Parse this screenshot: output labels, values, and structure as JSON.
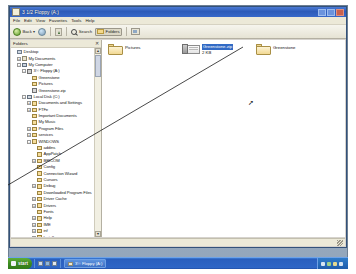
{
  "window": {
    "title": "3 1/2 Floppy (A:)",
    "icon": "floppy-icon",
    "buttons": {
      "minimize": "_",
      "maximize": "[]",
      "close": "X"
    }
  },
  "menubar": {
    "items": [
      "File",
      "Edit",
      "View",
      "Favorites",
      "Tools",
      "Help"
    ]
  },
  "toolbar": {
    "back_label": "Back",
    "back_dropdown": "▾",
    "forward_label": "",
    "up_label": "",
    "search_label": "Search",
    "folders_label": "Folders",
    "views_label": ""
  },
  "folders_pane": {
    "header": "Folders",
    "close_label": "✕",
    "tree": [
      {
        "label": "Desktop",
        "indent": 0,
        "expander": "",
        "icon": "desktop-icon"
      },
      {
        "label": "My Documents",
        "indent": 1,
        "expander": "+",
        "icon": "my-documents-icon"
      },
      {
        "label": "My Computer",
        "indent": 1,
        "expander": "-",
        "icon": "my-computer-icon"
      },
      {
        "label": "3½ Floppy (A:)",
        "indent": 2,
        "expander": "-",
        "icon": "floppy-icon"
      },
      {
        "label": "Greenstone",
        "indent": 3,
        "expander": "",
        "icon": "folder-icon"
      },
      {
        "label": "Pictures",
        "indent": 3,
        "expander": "",
        "icon": "folder-icon"
      },
      {
        "label": "Greenstone.zip",
        "indent": 3,
        "expander": "",
        "icon": "zip-icon"
      },
      {
        "label": "Local Disk (C:)",
        "indent": 2,
        "expander": "-",
        "icon": "disk-icon"
      },
      {
        "label": "Documents and Settings",
        "indent": 3,
        "expander": "+",
        "icon": "folder-icon"
      },
      {
        "label": "FTFe",
        "indent": 3,
        "expander": "+",
        "icon": "folder-icon"
      },
      {
        "label": "Important Documents",
        "indent": 3,
        "expander": "",
        "icon": "folder-icon"
      },
      {
        "label": "My Music",
        "indent": 3,
        "expander": "",
        "icon": "folder-icon"
      },
      {
        "label": "Program Files",
        "indent": 3,
        "expander": "+",
        "icon": "folder-icon"
      },
      {
        "label": "services",
        "indent": 3,
        "expander": "+",
        "icon": "folder-icon"
      },
      {
        "label": "WINDOWS",
        "indent": 3,
        "expander": "-",
        "icon": "folder-icon"
      },
      {
        "label": "addins",
        "indent": 4,
        "expander": "",
        "icon": "folder-icon"
      },
      {
        "label": "AppPatch",
        "indent": 4,
        "expander": "",
        "icon": "folder-icon"
      },
      {
        "label": "BRICOM",
        "indent": 4,
        "expander": "+",
        "icon": "folder-icon"
      },
      {
        "label": "Config",
        "indent": 4,
        "expander": "",
        "icon": "folder-icon"
      },
      {
        "label": "Connection Wizard",
        "indent": 4,
        "expander": "",
        "icon": "folder-icon"
      },
      {
        "label": "Cursors",
        "indent": 4,
        "expander": "",
        "icon": "folder-icon"
      },
      {
        "label": "Debug",
        "indent": 4,
        "expander": "+",
        "icon": "folder-icon"
      },
      {
        "label": "Downloaded Program Files",
        "indent": 4,
        "expander": "",
        "icon": "folder-icon"
      },
      {
        "label": "Driver Cache",
        "indent": 4,
        "expander": "+",
        "icon": "folder-icon"
      },
      {
        "label": "Drivers",
        "indent": 4,
        "expander": "+",
        "icon": "folder-icon"
      },
      {
        "label": "Fonts",
        "indent": 4,
        "expander": "",
        "icon": "folder-icon"
      },
      {
        "label": "Help",
        "indent": 4,
        "expander": "+",
        "icon": "folder-icon"
      },
      {
        "label": "IME",
        "indent": 4,
        "expander": "+",
        "icon": "folder-icon"
      },
      {
        "label": "inf",
        "indent": 4,
        "expander": "+",
        "icon": "folder-icon"
      },
      {
        "label": "Install",
        "indent": 4,
        "expander": "+",
        "icon": "folder-icon"
      },
      {
        "label": "java",
        "indent": 4,
        "expander": "+",
        "icon": "folder-icon"
      },
      {
        "label": "Media",
        "indent": 5,
        "expander": "",
        "icon": "folder-icon"
      },
      {
        "label": "Minidump",
        "indent": 5,
        "expander": "",
        "icon": "folder-icon"
      },
      {
        "label": "msagent",
        "indent": 4,
        "expander": "+",
        "icon": "folder-icon"
      },
      {
        "label": "msapps",
        "indent": 4,
        "expander": "+",
        "icon": "folder-icon"
      },
      {
        "label": "pss",
        "indent": 5,
        "expander": "",
        "icon": "folder-icon"
      }
    ],
    "scroll": {
      "up": "▲",
      "down": "▼"
    }
  },
  "file_pane": {
    "items": [
      {
        "label": "Pictures",
        "icon": "folder-icon",
        "selected": false,
        "sublabel": ""
      },
      {
        "label": "Greenstone.zip",
        "icon": "zip-icon",
        "selected": true,
        "sublabel": "2 KB"
      },
      {
        "label": "Greenstone",
        "icon": "folder-icon",
        "selected": false,
        "sublabel": ""
      }
    ]
  },
  "statusbar": {
    "text": ""
  },
  "taskbar": {
    "start_label": "start",
    "quick_launch": [
      "show-desktop-icon",
      "browser-icon",
      "media-player-icon"
    ],
    "windows": [
      {
        "label": "3½ Floppy (A:)",
        "icon": "floppy-icon"
      }
    ],
    "tray_icons": [
      "network-icon",
      "volume-icon",
      "shield-icon",
      "usb-icon"
    ],
    "clock": ""
  },
  "annotation": {
    "type": "drag-line",
    "description": "line drawn from the Greenstone folder to lower-left"
  },
  "colors": {
    "titlebar": "#2d5bb9",
    "selection": "#316ac5",
    "taskbar": "#2a5fbe",
    "start_button": "#3d8b20",
    "folder_yellow": "#f2d993"
  }
}
